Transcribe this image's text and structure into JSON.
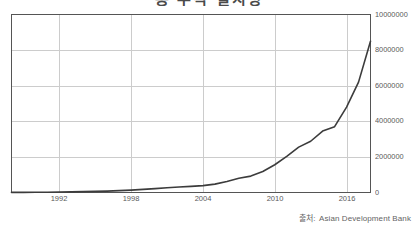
{
  "title": {
    "text": "총 누적 설치량",
    "cropped": true
  },
  "source": {
    "label": "출처:",
    "name": "Asian Development Bank"
  },
  "chart_data": {
    "type": "line",
    "title": "",
    "xlabel": "",
    "ylabel": "",
    "xlim": [
      1988,
      2018
    ],
    "ylim": [
      0,
      10000000
    ],
    "grid": true,
    "legend": "none",
    "line_color": "#3c3c3c",
    "grid_color": "#cccccc",
    "frame_color": "#555555",
    "tick_label_color": "#5a5a5a",
    "ytick_labels": [
      "10000000",
      "8000000",
      "6000000",
      "4000000",
      "2000000",
      "0"
    ],
    "ytick_values": [
      10000000,
      8000000,
      6000000,
      4000000,
      2000000,
      0
    ],
    "xtick_labels": [
      "1992",
      "1998",
      "2004",
      "2010",
      "2016"
    ],
    "xtick_values": [
      1992,
      1998,
      2004,
      2010,
      2016
    ],
    "x": [
      1988,
      1989,
      1990,
      1991,
      1992,
      1993,
      1994,
      1995,
      1996,
      1997,
      1998,
      1999,
      2000,
      2001,
      2002,
      2003,
      2004,
      2005,
      2006,
      2007,
      2008,
      2009,
      2010,
      2011,
      2012,
      2013,
      2014,
      2015,
      2016,
      2017,
      2018
    ],
    "values": [
      5000,
      8000,
      12000,
      18000,
      25000,
      35000,
      48000,
      62000,
      80000,
      105000,
      135000,
      175000,
      220000,
      270000,
      310000,
      345000,
      385000,
      470000,
      620000,
      800000,
      920000,
      1180000,
      1560000,
      2030000,
      2550000,
      2880000,
      3450000,
      3700000,
      4800000,
      6200000,
      8500000
    ]
  }
}
